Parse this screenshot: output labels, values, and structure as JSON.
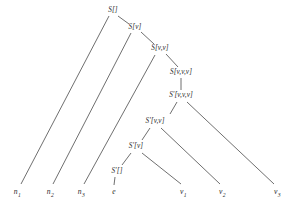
{
  "diagram": {
    "background_color": "#ffffff",
    "edge_color": "#4a4a4a",
    "text_color": "#2b2b2b",
    "nodes": [
      {
        "id": "s0",
        "label": "S[]",
        "x": 113,
        "y": 11
      },
      {
        "id": "s1",
        "label": "S[v]",
        "x": 135,
        "y": 28
      },
      {
        "id": "s2",
        "label": "S[v,v]",
        "x": 160,
        "y": 49
      },
      {
        "id": "s3",
        "label": "S[v,v,v]",
        "x": 181,
        "y": 73
      },
      {
        "id": "p3",
        "label": "S'[v,v,v]",
        "x": 181,
        "y": 96
      },
      {
        "id": "p2",
        "label": "S'[v,v]",
        "x": 155,
        "y": 122
      },
      {
        "id": "p1",
        "label": "S'[v]",
        "x": 136,
        "y": 147
      },
      {
        "id": "p0",
        "label": "S'[]",
        "x": 117,
        "y": 172
      }
    ],
    "leaves": [
      {
        "id": "n1",
        "base": "n",
        "sub": "1",
        "x": 17,
        "y": 192
      },
      {
        "id": "n2",
        "base": "n",
        "sub": "2",
        "x": 50,
        "y": 192
      },
      {
        "id": "n3",
        "base": "n",
        "sub": "3",
        "x": 81,
        "y": 192
      },
      {
        "id": "e",
        "base": "e",
        "sub": "",
        "x": 114,
        "y": 192
      },
      {
        "id": "v1",
        "base": "v",
        "sub": "1",
        "x": 183,
        "y": 192
      },
      {
        "id": "v2",
        "base": "v",
        "sub": "2",
        "x": 222,
        "y": 192
      },
      {
        "id": "v3",
        "base": "v",
        "sub": "3",
        "x": 277,
        "y": 192
      }
    ],
    "edges": [
      {
        "from": "s0",
        "to": "n1",
        "x1": 109,
        "y1": 16,
        "x2": 21,
        "y2": 184
      },
      {
        "from": "s0",
        "to": "s1",
        "x1": 118,
        "y1": 16,
        "x2": 129,
        "y2": 24
      },
      {
        "from": "s1",
        "to": "n2",
        "x1": 131,
        "y1": 33,
        "x2": 53,
        "y2": 184
      },
      {
        "from": "s1",
        "to": "s2",
        "x1": 141,
        "y1": 32,
        "x2": 154,
        "y2": 44
      },
      {
        "from": "s2",
        "to": "n3",
        "x1": 155,
        "y1": 55,
        "x2": 84,
        "y2": 184
      },
      {
        "from": "s2",
        "to": "s3",
        "x1": 166,
        "y1": 54,
        "x2": 178,
        "y2": 67
      },
      {
        "from": "s3",
        "to": "p3",
        "x1": 181,
        "y1": 78,
        "x2": 181,
        "y2": 90
      },
      {
        "from": "p3",
        "to": "p2",
        "x1": 177,
        "y1": 102,
        "x2": 170,
        "y2": 114
      },
      {
        "from": "p3",
        "to": "v3",
        "x1": 187,
        "y1": 102,
        "x2": 274,
        "y2": 184
      },
      {
        "from": "p2",
        "to": "p1",
        "x1": 150,
        "y1": 128,
        "x2": 142,
        "y2": 140
      },
      {
        "from": "p2",
        "to": "v2",
        "x1": 161,
        "y1": 128,
        "x2": 220,
        "y2": 184
      },
      {
        "from": "p1",
        "to": "p0",
        "x1": 131,
        "y1": 153,
        "x2": 122,
        "y2": 165
      },
      {
        "from": "p1",
        "to": "v1",
        "x1": 142,
        "y1": 153,
        "x2": 181,
        "y2": 184
      },
      {
        "from": "p0",
        "to": "e",
        "x1": 115,
        "y1": 177,
        "x2": 114,
        "y2": 185
      }
    ]
  }
}
